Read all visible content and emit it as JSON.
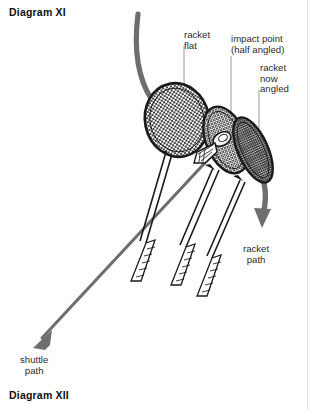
{
  "figure": {
    "title_top": "Diagram XI",
    "title_bottom": "Diagram XII",
    "colors": {
      "ink": "#1a1a1a",
      "path_arrow": "#6e6e6e",
      "leader_line": "#9a9a9a",
      "mesh": "#222222",
      "background": "#ffffff"
    }
  },
  "labels": {
    "racket_flat": "racket\nflat",
    "impact_point": "impact point\n(half angled)",
    "racket_now_angled": "racket\nnow\nangled",
    "racket_path": "racket\npath",
    "shuttle_path": "shuttle\npath"
  },
  "elements": {
    "racket_1_name": "racket-flat-position",
    "racket_2_name": "racket-impact-position",
    "racket_3_name": "racket-angled-position",
    "shuttlecock_name": "shuttlecock",
    "racket_path_arrow_name": "racket-path-arrow",
    "shuttle_path_arrow_name": "shuttle-path-arrow"
  }
}
